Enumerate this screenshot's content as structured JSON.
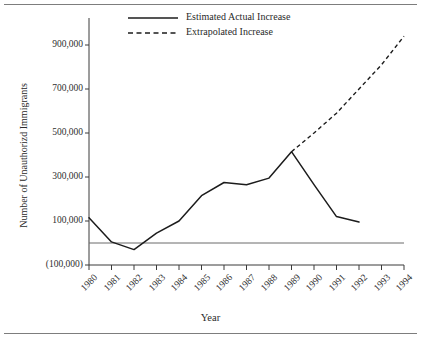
{
  "figure": {
    "has_top_rule": true,
    "has_bottom_rule": true,
    "background_color": "#ffffff",
    "line_color": "#1c1c1c"
  },
  "chart_data": {
    "type": "line",
    "title": "",
    "xlabel": "Year",
    "ylabel": "Number of Unauthorizd Immigrants",
    "x": [
      1980,
      1981,
      1982,
      1983,
      1984,
      1985,
      1986,
      1987,
      1988,
      1989,
      1990,
      1991,
      1992,
      1993,
      1994
    ],
    "xtick_labels": [
      "1980",
      "1981",
      "1982",
      "1983",
      "1984",
      "1985",
      "1986",
      "1987",
      "1988",
      "1989",
      "1990",
      "1991",
      "1992",
      "1993",
      "1994"
    ],
    "ytick_labels": [
      "900,000",
      "700,000",
      "500,000",
      "300,000",
      "100,000",
      "(100,000)"
    ],
    "ytick_values": [
      900000,
      700000,
      500000,
      300000,
      100000,
      -100000
    ],
    "ylim": [
      -100000,
      1000000
    ],
    "xlim": [
      1980,
      1994
    ],
    "grid": false,
    "zero_reference_line": 0,
    "legend_position": "top-center",
    "series": [
      {
        "name": "Estimated Actual Increase",
        "style": "solid",
        "x": [
          1980,
          1981,
          1982,
          1983,
          1984,
          1985,
          1986,
          1987,
          1988,
          1989,
          1990,
          1991,
          1992
        ],
        "values": [
          115000,
          5000,
          -30000,
          45000,
          100000,
          215000,
          275000,
          265000,
          295000,
          415000,
          265000,
          120000,
          95000
        ]
      },
      {
        "name": "Extrapolated Increase",
        "style": "dashed",
        "x": [
          1989,
          1990,
          1991,
          1992,
          1993,
          1994
        ],
        "values": [
          415000,
          500000,
          590000,
          700000,
          810000,
          940000
        ]
      }
    ]
  },
  "legend": {
    "entries": [
      {
        "label": "Estimated Actual Increase",
        "style": "solid"
      },
      {
        "label": "Extrapolated Increase",
        "style": "dashed"
      }
    ]
  }
}
